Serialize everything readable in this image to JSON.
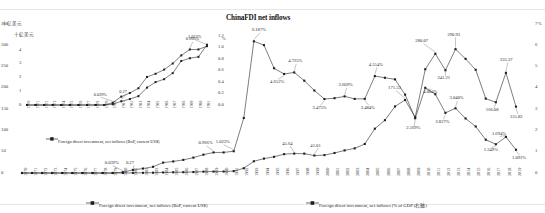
{
  "chart_data": {
    "type": "line",
    "title": "ChinaFDI net inflows",
    "xlabel": "",
    "ylabel_left": "十亿美元",
    "ylabel_right": "%",
    "grid": false,
    "legend_position": "bottom",
    "x": [
      "1970",
      "1971",
      "1972",
      "1973",
      "1974",
      "1975",
      "1976",
      "1977",
      "1978",
      "1979",
      "1980",
      "1981",
      "1982",
      "1983",
      "1984",
      "1985",
      "1986",
      "1987",
      "1988",
      "1989",
      "1990",
      "1991",
      "1992",
      "1993",
      "1994",
      "1995",
      "1996",
      "1997",
      "1998",
      "1999",
      "2000",
      "2001",
      "2002",
      "2003",
      "2004",
      "2005",
      "2006",
      "2007",
      "2008",
      "2009",
      "2010",
      "2011",
      "2012",
      "2013",
      "2014",
      "2015",
      "2016",
      "2017",
      "2018",
      "2019"
    ],
    "ylim_left": [
      0,
      350
    ],
    "yticks_left": [
      0,
      50,
      100,
      150,
      200,
      250,
      300,
      350
    ],
    "ylim_right": [
      0,
      7
    ],
    "yticks_right": [
      0,
      1,
      2,
      3,
      4,
      5,
      6,
      7
    ],
    "series": [
      {
        "name": "Foreign direct investment, net inflows (BoP, current US$)",
        "axis": "left",
        "units": "十亿美元",
        "values": [
          0,
          0,
          0,
          0,
          0,
          0,
          0,
          0,
          0,
          0,
          0.057,
          0.27,
          0.43,
          0.64,
          1.26,
          1.66,
          1.87,
          2.31,
          3.19,
          3.39,
          3.49,
          4.37,
          11.16,
          27.52,
          33.79,
          38.07,
          44.24,
          45.64,
          45.46,
          41.01,
          42.1,
          47.05,
          53.07,
          57.9,
          68.12,
          104.1,
          124.08,
          156.25,
          171.53,
          131.06,
          243.7,
          280.07,
          241.21,
          290.93,
          268.1,
          242.49,
          174.75,
          166.08,
          235.37,
          155.82
        ]
      },
      {
        "name": "Foreign direct investment, net inflows (% of GDP (右轴)",
        "axis": "right",
        "units": "%",
        "values": [
          0,
          0,
          0,
          0,
          0,
          0,
          0,
          0,
          0,
          0,
          0.039,
          0.145,
          0.209,
          0.291,
          0.488,
          0.543,
          0.616,
          0.722,
          0.862,
          0.966,
          0.966,
          1.023,
          2.585,
          6.187,
          6.009,
          4.921,
          4.652,
          4.725,
          4.337,
          3.876,
          3.475,
          3.514,
          3.6,
          3.481,
          3.484,
          4.554,
          4.475,
          4.399,
          3.682,
          2.569,
          4.004,
          3.7,
          2.827,
          3.04,
          2.561,
          2.186,
          1.564,
          1.349,
          1.694,
          1.091
        ]
      }
    ],
    "point_labels": [
      {
        "series": 0,
        "year": "1981",
        "text": "0.27"
      },
      {
        "series": 0,
        "year": "1997",
        "text": "45.64"
      },
      {
        "series": 0,
        "year": "1999",
        "text": "41.01"
      },
      {
        "series": 0,
        "year": "2008",
        "text": "171.53"
      },
      {
        "series": 0,
        "year": "2011",
        "text": "280.07"
      },
      {
        "series": 0,
        "year": "2012",
        "text": "241.21"
      },
      {
        "series": 0,
        "year": "2013",
        "text": "290.93"
      },
      {
        "series": 0,
        "year": "2017",
        "text": "166.08"
      },
      {
        "series": 0,
        "year": "2018",
        "text": "235.37"
      },
      {
        "series": 0,
        "year": "2019",
        "text": "155.82"
      },
      {
        "series": 1,
        "year": "1980",
        "text": "0.039%"
      },
      {
        "series": 1,
        "year": "1989",
        "text": "0.966%"
      },
      {
        "series": 1,
        "year": "1991",
        "text": "1.023%"
      },
      {
        "series": 1,
        "year": "1993",
        "text": "6.187%"
      },
      {
        "series": 1,
        "year": "1996",
        "text": "4.652%"
      },
      {
        "series": 1,
        "year": "1997",
        "text": "4.725%"
      },
      {
        "series": 1,
        "year": "2000",
        "text": "3.475%"
      },
      {
        "series": 1,
        "year": "2002",
        "text": "3.609%"
      },
      {
        "series": 1,
        "year": "2004",
        "text": "3.484%"
      },
      {
        "series": 1,
        "year": "2005",
        "text": "4.554%"
      },
      {
        "series": 1,
        "year": "2009",
        "text": "2.569%"
      },
      {
        "series": 1,
        "year": "2010",
        "text": "4.004%"
      },
      {
        "series": 1,
        "year": "2012",
        "text": "2.827%"
      },
      {
        "series": 1,
        "year": "2013",
        "text": "3.040%"
      },
      {
        "series": 1,
        "year": "2017",
        "text": "1.349%"
      },
      {
        "series": 1,
        "year": "2018",
        "text": "1.694%"
      },
      {
        "series": 1,
        "year": "2019",
        "text": "1.091%"
      }
    ],
    "inset": {
      "x": [
        "1970",
        "1971",
        "1972",
        "1973",
        "1974",
        "1975",
        "1976",
        "1977",
        "1978",
        "1979",
        "1980",
        "1981",
        "1982",
        "1983",
        "1984",
        "1985",
        "1986",
        "1987",
        "1988",
        "1989",
        "1990",
        "1991"
      ],
      "ylabel_left": "十亿美元",
      "ylabel_right": "%",
      "ylim_left": [
        0,
        5
      ],
      "yticks_left": [
        0,
        1,
        2,
        3,
        4,
        5
      ],
      "ylim_right": [
        0,
        1.2
      ],
      "yticks_right": [
        "0.0",
        "0.2",
        "0.4",
        "0.6",
        "0.8",
        "1.0",
        "1.2"
      ],
      "series": [
        {
          "name": "Foreign direct investment, net inflows (BoP, current US$)",
          "axis": "left",
          "values": [
            0,
            0,
            0,
            0,
            0,
            0,
            0,
            0,
            0,
            0,
            0.057,
            0.27,
            0.43,
            0.64,
            1.26,
            1.66,
            1.87,
            2.31,
            3.19,
            3.39,
            3.49,
            4.37
          ]
        },
        {
          "name": "Foreign direct investment, net inflows (% of GDP (右轴)",
          "axis": "right",
          "values": [
            0,
            0,
            0,
            0,
            0,
            0,
            0,
            0,
            0,
            0,
            0.039,
            0.145,
            0.209,
            0.291,
            0.488,
            0.543,
            0.616,
            0.722,
            0.862,
            0.966,
            0.966,
            1.023
          ]
        }
      ],
      "point_labels": [
        {
          "series": 0,
          "year": "1981",
          "text": "0.27"
        },
        {
          "series": 1,
          "year": "1980",
          "text": "0.039%"
        },
        {
          "series": 1,
          "year": "1989",
          "text": "0.966%"
        },
        {
          "series": 1,
          "year": "1991",
          "text": "1.023%"
        }
      ],
      "legend": "Foreign direct investment, net inflows (BoP, current US$)"
    },
    "legend": [
      "Foreign direct investment, net inflows (BoP, current US$)",
      "Foreign direct investment, net inflows (% of GDP (右轴)"
    ]
  }
}
